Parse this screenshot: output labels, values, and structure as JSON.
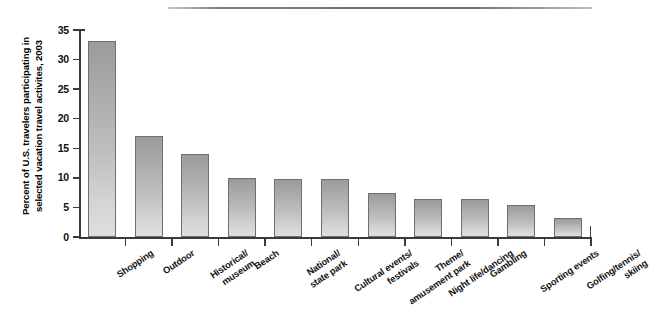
{
  "chart_data": {
    "type": "bar",
    "title": "",
    "subtitle": "",
    "xlabel": "",
    "ylabel": "Percent of U.S. travelers participating in selected vacation travel activites, 2003",
    "ylabel_lines": [
      "Percent of U.S. travelers participating in",
      "selected vacation travel activites, 2003"
    ],
    "categories": [
      "Shopping",
      "Outdoor",
      "Historical/\nmuseum",
      "Beach",
      "National/\nstate park",
      "Cultural events/\nfestivals",
      "Theme/\namusement park",
      "Night life/dancing",
      "Gambling",
      "Sporting events",
      "Golfing/tennis/\nskiing"
    ],
    "values": [
      33.1,
      17.0,
      14.0,
      9.9,
      9.8,
      9.8,
      7.5,
      6.5,
      6.4,
      5.4,
      3.2
    ],
    "ylim": [
      0,
      35
    ],
    "yticks": [
      0,
      5,
      10,
      15,
      20,
      25,
      30,
      35
    ],
    "ytick_labels": [
      "0",
      "5",
      "10",
      "15",
      "20",
      "25",
      "30",
      "35"
    ],
    "grid": false,
    "legend": null,
    "bar_color_top": "#9b9b9b",
    "bar_color_bottom": "#dedede",
    "bar_border_color": "#6f6f6f",
    "axis_color": "#3a3a3a",
    "background": "#ffffff"
  },
  "decor": {
    "top_rule": "horizontal-rule"
  }
}
